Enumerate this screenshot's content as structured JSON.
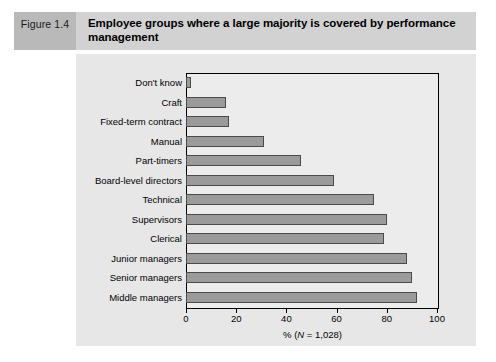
{
  "figure": {
    "tag": "Figure 1.4",
    "title": "Employee groups where a large majority is covered by performance management"
  },
  "chart_data": {
    "type": "bar",
    "orientation": "horizontal",
    "title": "Employee groups where a large majority is covered by performance management",
    "xlabel": "% (N = 1,028)",
    "ylabel": "",
    "xlim": [
      0,
      100
    ],
    "xticks": [
      0,
      20,
      40,
      60,
      80,
      100
    ],
    "grid": false,
    "legend": null,
    "bar_color": "#9b9b9b",
    "bar_edge_color": "#4a4a4a",
    "plot_background": "#ececec",
    "panel_background": "#e7e7e7",
    "categories": [
      "Don't know",
      "Craft",
      "Fixed-term contract",
      "Manual",
      "Part-timers",
      "Board-level directors",
      "Technical",
      "Supervisors",
      "Clerical",
      "Junior managers",
      "Senior managers",
      "Middle managers"
    ],
    "values": [
      2,
      16,
      17,
      31,
      46,
      59,
      75,
      80,
      79,
      88,
      90,
      92
    ]
  },
  "axis": {
    "x_label_prefix": "% (",
    "x_label_italic": "N",
    "x_label_suffix": " = 1,028)"
  }
}
